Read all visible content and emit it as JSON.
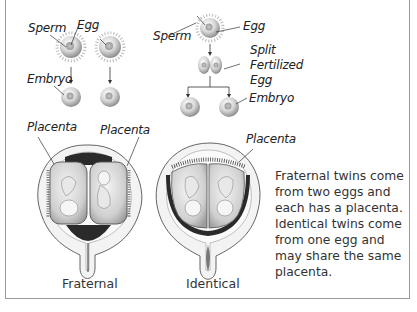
{
  "diagram": {
    "type": "biology-illustration",
    "topic": "Fraternal vs identical twins"
  },
  "labels": {
    "fraternal_sperm": "Sperm",
    "fraternal_egg": "Egg",
    "fraternal_embryo": "Embryo",
    "identical_sperm": "Sperm",
    "identical_egg": "Egg",
    "split_line1": "Split",
    "split_line2": "Fertilized",
    "split_line3": "Egg",
    "identical_embryo": "Embryo",
    "placenta_left1": "Placenta",
    "placenta_left2": "Placenta",
    "placenta_identical": "Placenta"
  },
  "captions": {
    "fraternal": "Fraternal",
    "identical": "Identical"
  },
  "description": {
    "lines": [
      "Fraternal twins come",
      "from two eggs and",
      "each has a placenta.",
      "Identical twins come",
      "from one egg and",
      "may share the same",
      "placenta."
    ]
  },
  "colors": {
    "border": "#9a9a9a",
    "uterus_wall": "#f1f1f1",
    "dark_fluid": "#2a2a2a",
    "sac": "#d9d9d9"
  }
}
